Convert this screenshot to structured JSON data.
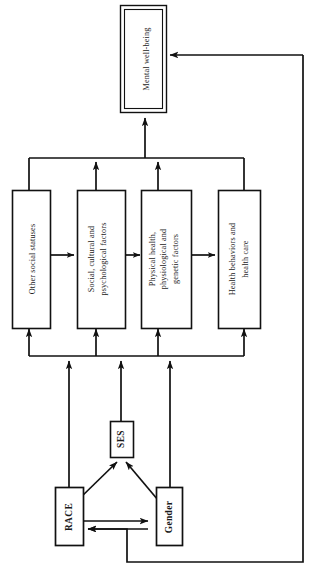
{
  "diagram": {
    "orientation": "rotated-90-ccw",
    "background_color": "#ffffff",
    "line_color": "#111111",
    "nodes": {
      "outcome": {
        "id": "mental-well-being",
        "label": "Mental well-being",
        "style": "double-border"
      },
      "mediators": [
        {
          "id": "other-social-statuses",
          "label": "Other social statuses",
          "lines": [
            "Other social statuses"
          ]
        },
        {
          "id": "social-cultural-psychological-factors",
          "label": "Social, cultural and psychological factors",
          "lines": [
            "Social, cultural and",
            "psychological factors"
          ]
        },
        {
          "id": "physical-health-physiological-genetic-factors",
          "label": "Physical health, physiological and genetic factors",
          "lines": [
            "Physical health,",
            "physiological  and",
            "genetic factors"
          ]
        },
        {
          "id": "health-behaviors-and-health-care",
          "label": "Health behaviors and health care",
          "lines": [
            "Health behaviors and",
            "health care"
          ]
        }
      ],
      "determinants": [
        {
          "id": "ses",
          "label": "SES",
          "bold": true
        },
        {
          "id": "race",
          "label": "RACE",
          "bold": true
        },
        {
          "id": "gender",
          "label": "Gender",
          "bold": true
        }
      ]
    },
    "edges": [
      {
        "id": "mediators-bus-to-outcome",
        "from": "mediator-bus",
        "to": "mental-well-being",
        "type": "arrow"
      },
      {
        "id": "outcome-feedback",
        "from": "mental-well-being",
        "to": "race",
        "type": "feedback-arrow"
      },
      {
        "id": "social-cultural-to-bus",
        "from": "social-cultural-psychological-factors",
        "to": "mediator-bus",
        "type": "arrow"
      },
      {
        "id": "physical-health-to-bus",
        "from": "physical-health-physiological-genetic-factors",
        "to": "mediator-bus",
        "type": "arrow"
      },
      {
        "id": "other-social-statuses-to-bus",
        "from": "other-social-statuses",
        "to": "mediator-bus",
        "type": "line"
      },
      {
        "id": "health-behaviors-to-bus",
        "from": "health-behaviors-and-health-care",
        "to": "mediator-bus",
        "type": "line"
      },
      {
        "id": "other-social-statuses-bidirectional-social",
        "from": "other-social-statuses",
        "to": "social-cultural-psychological-factors",
        "type": "double-arrow"
      },
      {
        "id": "social-bidirectional-physical",
        "from": "social-cultural-psychological-factors",
        "to": "physical-health-physiological-genetic-factors",
        "type": "double-arrow"
      },
      {
        "id": "physical-bidirectional-health-behaviors",
        "from": "physical-health-physiological-genetic-factors",
        "to": "health-behaviors-and-health-care",
        "type": "double-arrow"
      },
      {
        "id": "lower-bus-to-other-social-statuses",
        "from": "determinant-bus",
        "to": "other-social-statuses",
        "type": "arrow"
      },
      {
        "id": "lower-bus-to-social-cultural",
        "from": "determinant-bus",
        "to": "social-cultural-psychological-factors",
        "type": "arrow"
      },
      {
        "id": "lower-bus-to-physical-health",
        "from": "determinant-bus",
        "to": "physical-health-physiological-genetic-factors",
        "type": "arrow"
      },
      {
        "id": "lower-bus-to-health-behaviors",
        "from": "determinant-bus",
        "to": "health-behaviors-and-health-care",
        "type": "arrow"
      },
      {
        "id": "race-to-bus",
        "from": "race",
        "to": "determinant-bus",
        "type": "arrow"
      },
      {
        "id": "ses-to-bus",
        "from": "ses",
        "to": "determinant-bus",
        "type": "arrow"
      },
      {
        "id": "gender-to-bus",
        "from": "gender",
        "to": "determinant-bus",
        "type": "arrow"
      },
      {
        "id": "race-to-ses",
        "from": "race",
        "to": "ses",
        "type": "arrow"
      },
      {
        "id": "gender-to-ses",
        "from": "gender",
        "to": "ses",
        "type": "arrow"
      },
      {
        "id": "race-gender-bidirectional",
        "from": "race",
        "to": "gender",
        "type": "double-arrow"
      }
    ]
  }
}
